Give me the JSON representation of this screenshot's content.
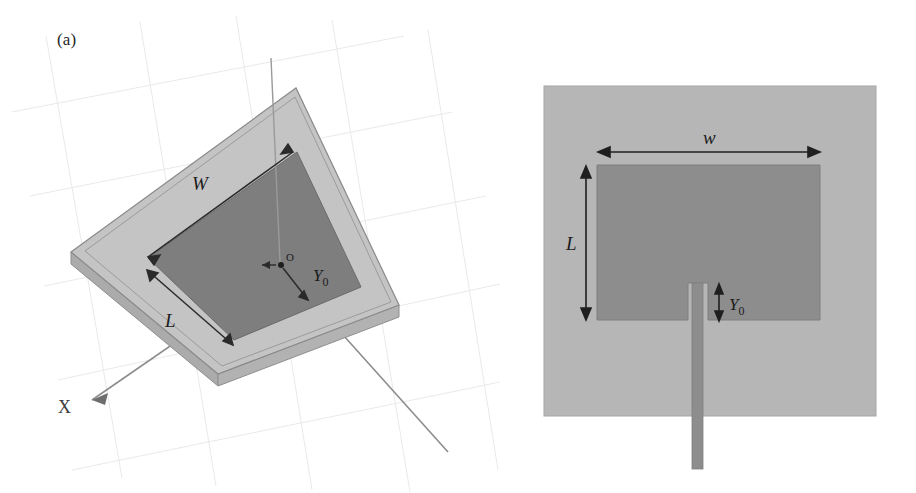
{
  "figure": {
    "panels": [
      {
        "id": "a",
        "label": "(a)",
        "view": "3d-perspective",
        "description": "Three-dimensional perspective view of rectangular microstrip patch antenna on dielectric substrate slab",
        "annotations": {
          "width_label": "W",
          "length_label": "L",
          "origin_label": "O",
          "inset_label": "Y",
          "inset_sub": "0",
          "axis_x_label": "X"
        },
        "colors": {
          "substrate": "#c0c0c0",
          "substrate_top": "#c6c6c6",
          "substrate_edge": "#9a9a9a",
          "patch": "#7e7e7e",
          "outline": "#6e6e6e",
          "grid": "#e8e8e8",
          "axis": "#8a8a8a",
          "arrow": "#2a2a2a"
        }
      },
      {
        "id": "b",
        "label": "(b)",
        "view": "top-plan",
        "description": "Top plan view of the inset-fed rectangular patch with microstrip feed line",
        "annotations": {
          "width_label": "w",
          "length_label": "L",
          "inset_label": "Y",
          "inset_sub": "0"
        },
        "colors": {
          "substrate": "#b4b4b4",
          "patch": "#8d8d8d",
          "feedline": "#8d8d8d",
          "arrow": "#1f1f1f",
          "border": "#a0a0a0"
        }
      }
    ]
  }
}
